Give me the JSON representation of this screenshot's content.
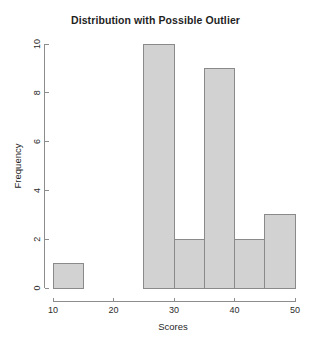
{
  "chart_data": {
    "type": "bar",
    "chart_subtype": "histogram",
    "title": "Distribution with Possible Outlier",
    "xlabel": "Scores",
    "ylabel": "Frequency",
    "xlim": [
      10,
      50
    ],
    "ylim": [
      0,
      10
    ],
    "xticks": [
      10,
      20,
      30,
      40,
      50
    ],
    "xtick_labels": [
      "10",
      "20",
      "30",
      "40",
      "50"
    ],
    "yticks": [
      0,
      2,
      4,
      6,
      8,
      10
    ],
    "ytick_labels": [
      "0",
      "2",
      "4",
      "6",
      "8",
      "10"
    ],
    "grid": false,
    "legend": false,
    "legend_position": "none",
    "bin_width": 5,
    "bin_edges": [
      10,
      15,
      20,
      25,
      30,
      35,
      40,
      45,
      50
    ],
    "categories": [
      "10-15",
      "15-20",
      "20-25",
      "25-30",
      "30-35",
      "35-40",
      "40-45",
      "45-50"
    ],
    "values": [
      1,
      0,
      0,
      10,
      2,
      9,
      2,
      3
    ],
    "bars": [
      {
        "label": "10-15",
        "x0": 10,
        "x1": 15,
        "value": 1
      },
      {
        "label": "15-20",
        "x0": 15,
        "x1": 20,
        "value": 0
      },
      {
        "label": "20-25",
        "x0": 20,
        "x1": 25,
        "value": 0
      },
      {
        "label": "25-30",
        "x0": 25,
        "x1": 30,
        "value": 10
      },
      {
        "label": "30-35",
        "x0": 30,
        "x1": 35,
        "value": 2
      },
      {
        "label": "35-40",
        "x0": 35,
        "x1": 40,
        "value": 9
      },
      {
        "label": "40-45",
        "x0": 40,
        "x1": 45,
        "value": 2
      },
      {
        "label": "45-50",
        "x0": 45,
        "x1": 50,
        "value": 3
      }
    ],
    "colors": {
      "background": "#ffffff",
      "bar_fill": "#d2d2d2",
      "bar_stroke": "#8a8a8a",
      "axis": "#8d8d8d",
      "text": "#1f1f1f"
    }
  }
}
